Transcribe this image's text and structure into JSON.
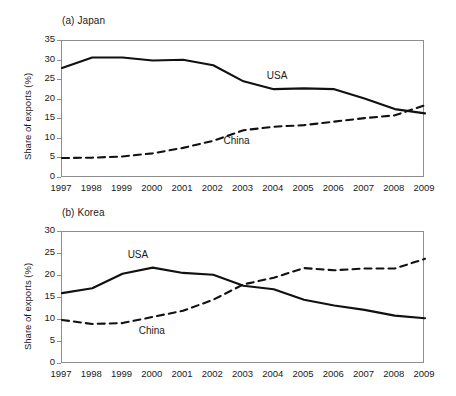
{
  "figure": {
    "background": "#ffffff",
    "line_color": "#111111",
    "axis_color": "#8e8e8e"
  },
  "chart_data": [
    {
      "type": "line",
      "title": "(a) Japan",
      "xlabel": "",
      "ylabel": "Share of exports (%)",
      "x": [
        1997,
        1998,
        1999,
        2000,
        2001,
        2002,
        2003,
        2004,
        2005,
        2006,
        2007,
        2008,
        2009
      ],
      "xtick_labels": [
        "1997",
        "1998",
        "1999",
        "2000",
        "2001",
        "2002",
        "2003",
        "2004",
        "2005",
        "2006",
        "2007",
        "2008",
        "2009"
      ],
      "ytick_labels": [
        "0",
        "5",
        "10",
        "15",
        "20",
        "25",
        "30",
        "35"
      ],
      "yticks": [
        0,
        5,
        10,
        15,
        20,
        25,
        30,
        35
      ],
      "ylim": [
        0,
        35
      ],
      "xlim": [
        1997,
        2009
      ],
      "grid": false,
      "legend": "inline-annotations",
      "series": [
        {
          "name": "USA",
          "style": "solid",
          "label_x": 2004.2,
          "label_y": 25.6,
          "values": [
            28.1,
            30.8,
            30.8,
            30.0,
            30.2,
            28.8,
            24.7,
            22.7,
            22.9,
            22.7,
            20.3,
            17.6,
            16.5
          ]
        },
        {
          "name": "China",
          "style": "dashed",
          "label_x": 2002.9,
          "label_y": 8.9,
          "values": [
            5.1,
            5.2,
            5.5,
            6.3,
            7.7,
            9.5,
            12.2,
            13.1,
            13.5,
            14.4,
            15.3,
            16.0,
            18.6
          ]
        }
      ]
    },
    {
      "type": "line",
      "title": "(b) Korea",
      "xlabel": "",
      "ylabel": "Share of exports (%)",
      "x": [
        1997,
        1998,
        1999,
        2000,
        2001,
        2002,
        2003,
        2004,
        2005,
        2006,
        2007,
        2008,
        2009
      ],
      "xtick_labels": [
        "1997",
        "1998",
        "1999",
        "2000",
        "2001",
        "2002",
        "2003",
        "2004",
        "2005",
        "2006",
        "2007",
        "2008",
        "2009"
      ],
      "ytick_labels": [
        "0",
        "5",
        "10",
        "15",
        "20",
        "25",
        "30"
      ],
      "yticks": [
        0,
        5,
        10,
        15,
        20,
        25,
        30
      ],
      "ylim": [
        0,
        30
      ],
      "xlim": [
        1997,
        2009
      ],
      "grid": false,
      "legend": "inline-annotations",
      "series": [
        {
          "name": "USA",
          "style": "solid",
          "label_x": 1999.6,
          "label_y": 24.3,
          "values": [
            16.1,
            17.2,
            20.5,
            21.9,
            20.7,
            20.3,
            17.8,
            17.0,
            14.6,
            13.3,
            12.3,
            11.0,
            10.4
          ]
        },
        {
          "name": "China",
          "style": "dashed",
          "label_x": 2000.1,
          "label_y": 7.1,
          "values": [
            10.0,
            9.1,
            9.3,
            10.7,
            12.1,
            14.6,
            18.1,
            19.6,
            21.8,
            21.3,
            21.7,
            21.7,
            23.9
          ]
        }
      ]
    }
  ]
}
